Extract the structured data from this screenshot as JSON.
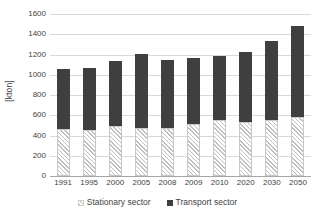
{
  "chart_data": {
    "type": "bar",
    "subtype": "stacked-bar",
    "title": "",
    "xlabel": "",
    "ylabel": "[kton]",
    "ylim": [
      0,
      1600
    ],
    "ytick_interval": 200,
    "yticks": [
      0,
      200,
      400,
      600,
      800,
      1000,
      1200,
      1400,
      1600
    ],
    "ytick_labels": [
      "0",
      "200",
      "400",
      "600",
      "800",
      "1000",
      "1200",
      "1400",
      "1600"
    ],
    "grid": true,
    "grid_axis": "y",
    "legend_position": "bottom",
    "categories": [
      "1991",
      "1995",
      "2000",
      "2005",
      "2008",
      "2009",
      "2010",
      "2020",
      "2030",
      "2050"
    ],
    "series": [
      {
        "name": "Stationary sector",
        "pattern": "hatched",
        "color": "#ffffff",
        "hatch_color": "#bfbfbf",
        "values": [
          460,
          450,
          490,
          475,
          470,
          515,
          555,
          535,
          555,
          580
        ]
      },
      {
        "name": "Transport sector",
        "pattern": "solid",
        "color": "#3f3f3f",
        "values": [
          595,
          620,
          650,
          730,
          680,
          650,
          635,
          690,
          775,
          900
        ]
      }
    ],
    "totals": [
      1055,
      1070,
      1140,
      1205,
      1150,
      1165,
      1190,
      1225,
      1330,
      1480
    ],
    "axis_line_color": "#a6a6a6",
    "gridline_color": "#d9d9d9"
  },
  "legend": {
    "items": [
      {
        "label": "Stationary sector",
        "swatch": "stationary-swatch-icon"
      },
      {
        "label": "Transport sector",
        "swatch": "transport-swatch-icon"
      }
    ]
  }
}
